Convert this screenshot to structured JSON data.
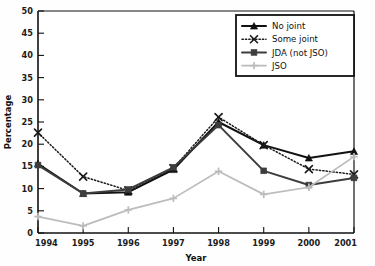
{
  "chart_data": {
    "type": "line",
    "title": "",
    "xlabel": "Year",
    "ylabel": "Percentage",
    "categories": [
      "1994",
      "1995",
      "1996",
      "1997",
      "1998",
      "1999",
      "2000",
      "2001"
    ],
    "x": [
      1994,
      1995,
      1996,
      1997,
      1998,
      1999,
      2000,
      2001
    ],
    "xlim": [
      1994,
      2001
    ],
    "ylim": [
      0,
      50
    ],
    "yticks": [
      0,
      5,
      10,
      15,
      20,
      25,
      30,
      35,
      40,
      45,
      50
    ],
    "ytick_labels": [
      "0",
      "5",
      "10",
      "15",
      "20",
      "25",
      "30",
      "35",
      "40",
      "45",
      "50"
    ],
    "grid": false,
    "legend_position": "top-right",
    "series": [
      {
        "name": "No joint",
        "marker": "triangle",
        "line_style": "solid",
        "color": "#111111",
        "values": [
          15.6,
          8.9,
          9.2,
          14.3,
          25.0,
          19.8,
          16.9,
          18.4
        ]
      },
      {
        "name": "Some joint",
        "marker": "x",
        "line_style": "dotted",
        "color": "#1a1a1a",
        "values": [
          22.6,
          12.7,
          9.6,
          14.6,
          26.1,
          19.8,
          14.4,
          13.2
        ]
      },
      {
        "name": "JDA (not JSO)",
        "marker": "square",
        "line_style": "solid",
        "color": "#3d3d3d",
        "values": [
          15.3,
          8.9,
          9.8,
          14.8,
          24.3,
          14.0,
          10.8,
          12.4
        ]
      },
      {
        "name": "JSO",
        "marker": "plus",
        "line_style": "solid",
        "color": "#bcbcbc",
        "values": [
          3.7,
          1.6,
          5.2,
          7.8,
          13.9,
          8.7,
          10.3,
          17.2
        ]
      }
    ]
  },
  "legend": {
    "items": [
      {
        "label": "No joint"
      },
      {
        "label": "Some joint"
      },
      {
        "label": "JDA (not JSO)"
      },
      {
        "label": "JSO"
      }
    ]
  },
  "colors": {
    "background": "#fefefe",
    "axis": "#111111",
    "no_joint": "#111111",
    "some_joint": "#1a1a1a",
    "jda_not_jso": "#3d3d3d",
    "jso": "#bcbcbc"
  }
}
